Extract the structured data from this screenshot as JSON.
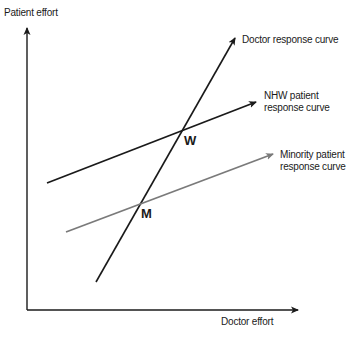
{
  "axes": {
    "y_label": "Patient effort",
    "x_label": "Doctor effort"
  },
  "curves": {
    "doctor": {
      "label": "Doctor response curve",
      "color": "#1a1a1a"
    },
    "nhw": {
      "label_line1": "NHW patient",
      "label_line2": "response curve",
      "color": "#1a1a1a"
    },
    "minority": {
      "label_line1": "Minority patient",
      "label_line2": "response curve",
      "color": "#7a7a7a"
    }
  },
  "points": {
    "w": "W",
    "m": "M"
  }
}
